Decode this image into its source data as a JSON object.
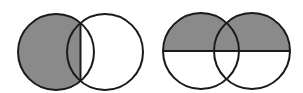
{
  "figure": {
    "colors": {
      "shade": "#8a8a8a",
      "stroke": "#1a1a1a",
      "background": "#ffffff"
    },
    "diagrams": [
      {
        "name": "venn-left",
        "circles": [
          {
            "cx": 56,
            "cy": 52,
            "r": 38
          },
          {
            "cx": 105,
            "cy": 52,
            "r": 38
          }
        ],
        "divider": {
          "orientation": "vertical",
          "x": 80.5
        },
        "shaded_region": "left circle, left of vertical chord through intersection points"
      },
      {
        "name": "venn-right",
        "circles": [
          {
            "cx": 201,
            "cy": 51,
            "r": 38
          },
          {
            "cx": 252,
            "cy": 51,
            "r": 38
          }
        ],
        "divider": {
          "orientation": "horizontal",
          "y": 51
        },
        "shaded_region": "upper half of union of both circles"
      }
    ]
  }
}
